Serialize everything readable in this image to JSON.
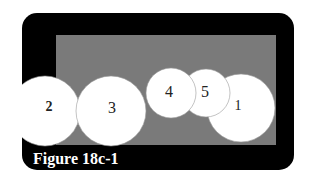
{
  "figure": {
    "caption": "Figure 18c-1",
    "colors": {
      "frame": "#000000",
      "field": "#7a7a7a",
      "circle": "#ffffff",
      "circle_stroke": "#9a9a9a",
      "label": "#222222",
      "caption": "#ffffff"
    },
    "circles": [
      {
        "id": "2",
        "label": "2",
        "cx": 45,
        "cy": 111,
        "r": 35
      },
      {
        "id": "3",
        "label": "3",
        "cx": 111,
        "cy": 111,
        "r": 35
      },
      {
        "id": "4",
        "label": "4",
        "cx": 171,
        "cy": 93,
        "r": 25
      },
      {
        "id": "5",
        "label": "5",
        "cx": 206,
        "cy": 93,
        "r": 24
      },
      {
        "id": "1",
        "label": "1",
        "cx": 241,
        "cy": 108,
        "r": 34
      }
    ]
  }
}
